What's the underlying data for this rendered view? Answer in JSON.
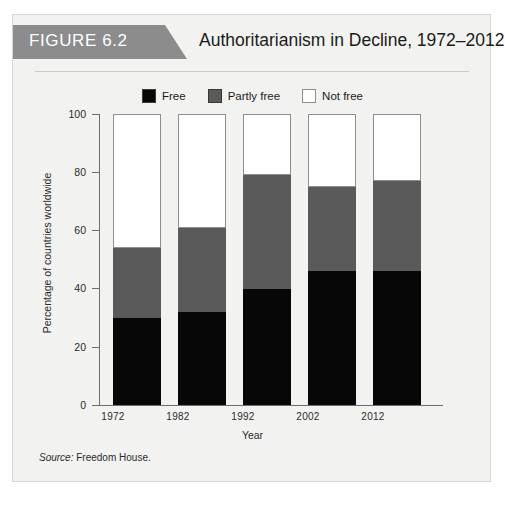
{
  "figure": {
    "number_label": "FIGURE 6.2",
    "title": "Authoritarianism in Decline, 1972–2012",
    "source_prefix": "Source:",
    "source_text": "Freedom House."
  },
  "legend": {
    "items": [
      {
        "label": "Free",
        "color": "#070707"
      },
      {
        "label": "Partly free",
        "color": "#5a5a5a"
      },
      {
        "label": "Not free",
        "color": "#ffffff"
      }
    ]
  },
  "axis": {
    "y_ticks": [
      "100",
      "80",
      "60",
      "40",
      "20",
      "0"
    ],
    "y_title": "Percentage of countries worldwide",
    "x_title": "Year",
    "x_ticks": [
      "1972",
      "1982",
      "1992",
      "2002",
      "2012"
    ]
  },
  "chart_data": {
    "type": "bar",
    "stacked": true,
    "title": "Authoritarianism in Decline, 1972–2012",
    "xlabel": "Year",
    "ylabel": "Percentage of countries worldwide",
    "ylim": [
      0,
      100
    ],
    "yticks": [
      0,
      20,
      40,
      60,
      80,
      100
    ],
    "grid": false,
    "legend_position": "top-center",
    "categories": [
      "1972",
      "1982",
      "1992",
      "2002",
      "2012"
    ],
    "series": [
      {
        "name": "Free",
        "color": "#070707",
        "values": [
          30,
          32,
          40,
          46,
          46
        ]
      },
      {
        "name": "Partly free",
        "color": "#5a5a5a",
        "values": [
          24,
          29,
          39,
          29,
          31
        ]
      },
      {
        "name": "Not free",
        "color": "#ffffff",
        "values": [
          46,
          39,
          21,
          25,
          23
        ]
      }
    ],
    "cumulative_tops": {
      "free": [
        30,
        32,
        40,
        46,
        46
      ],
      "free_plus_partly": [
        54,
        61,
        79,
        75,
        77
      ],
      "total": [
        100,
        100,
        100,
        100,
        100
      ]
    },
    "source": "Source: Freedom House."
  }
}
